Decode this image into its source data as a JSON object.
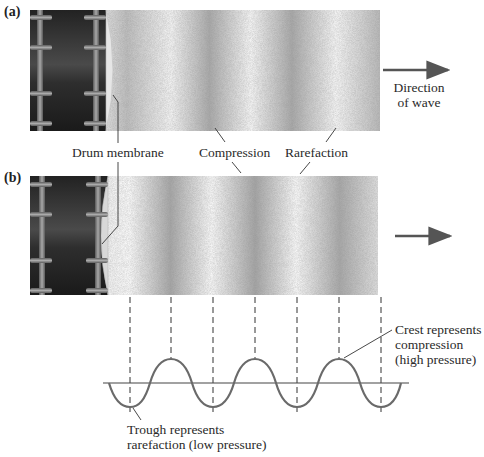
{
  "panels": {
    "a": {
      "label": "(a)"
    },
    "b": {
      "label": "(b)"
    }
  },
  "labels": {
    "drum_membrane": "Drum membrane",
    "compression": "Compression",
    "rarefaction": "Rarefaction",
    "direction_line1": "Direction",
    "direction_line2": "of wave",
    "crest_line1": "Crest represents",
    "crest_line2": "compression",
    "crest_line3": "(high pressure)",
    "trough_line1": "Trough represents",
    "trough_line2": "rarefaction (low pressure)"
  },
  "colors": {
    "drum_body": "#2b2b2b",
    "drum_rod": "#8a8a8a",
    "arrow": "#555555",
    "wave": "#666666",
    "axis": "#444444"
  },
  "wave": {
    "axis_y": 383,
    "crest_y": 359,
    "trough_y": 407,
    "dashed_x": [
      130,
      171,
      213,
      255,
      297,
      339,
      381
    ],
    "crests_x": [
      171,
      255,
      339
    ],
    "troughs_x": [
      130,
      213,
      297,
      381
    ]
  }
}
